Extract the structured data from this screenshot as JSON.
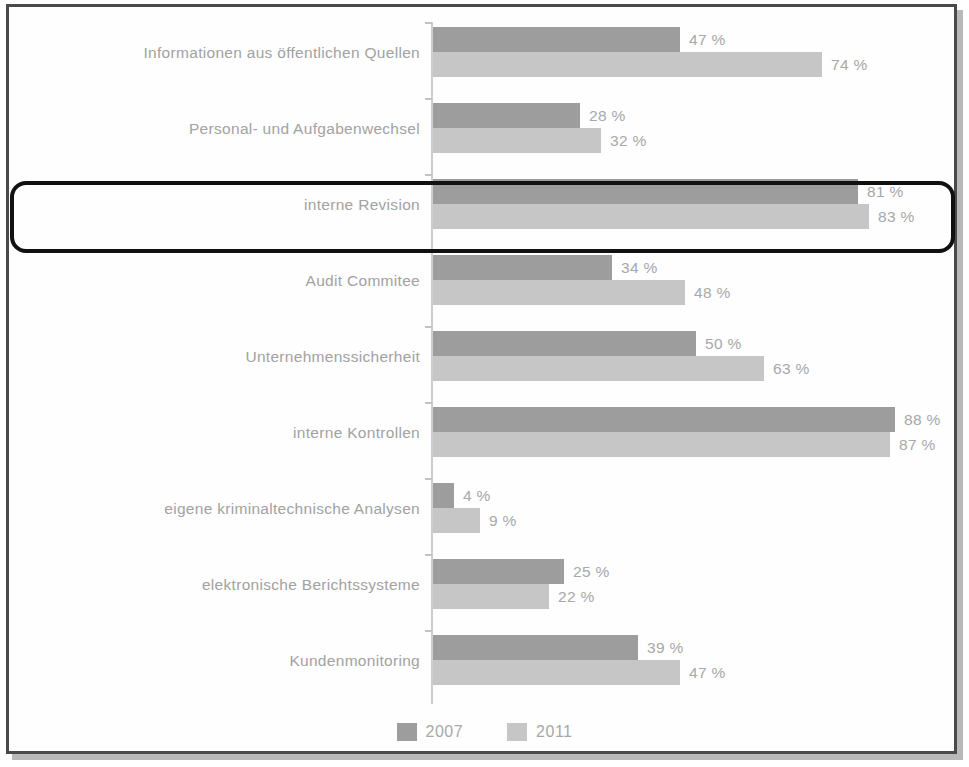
{
  "chart_data": {
    "type": "bar",
    "orientation": "horizontal",
    "title": "",
    "xlabel": "",
    "ylabel": "",
    "xlim": [
      0,
      100
    ],
    "grid": false,
    "legend_position": "bottom",
    "value_suffix": "%",
    "categories": [
      "Informationen aus öffentlichen Quellen",
      "Personal- und Aufgabenwechsel",
      "interne Revision",
      "Audit Commitee",
      "Unternehmenssicherheit",
      "interne Kontrollen",
      "eigene kriminaltechnische Analysen",
      "elektronische Berichtssysteme",
      "Kundenmonitoring"
    ],
    "series": [
      {
        "name": "2007",
        "color": "#9d9d9d",
        "values": [
          47,
          28,
          81,
          34,
          50,
          88,
          4,
          25,
          39
        ],
        "labels": [
          "47 %",
          "28 %",
          "81 %",
          "34 %",
          "50 %",
          "88 %",
          "4 %",
          "25 %",
          "39 %"
        ]
      },
      {
        "name": "2011",
        "color": "#c6c6c6",
        "values": [
          74,
          32,
          83,
          48,
          63,
          87,
          9,
          22,
          47
        ],
        "labels": [
          "74 %",
          "32 %",
          "83 %",
          "48 %",
          "63 %",
          "87 %",
          "9 %",
          "22 %",
          "47 %"
        ]
      }
    ],
    "annotations": [
      {
        "type": "highlight-rectangle",
        "target_category": "interne Revision",
        "color": "#111111"
      }
    ]
  },
  "legend": {
    "items": [
      {
        "label": "2007",
        "color": "#9d9d9d"
      },
      {
        "label": "2011",
        "color": "#c6c6c6"
      }
    ]
  }
}
